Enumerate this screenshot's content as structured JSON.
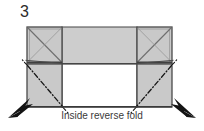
{
  "figure": {
    "step_number": "3",
    "caption": "Inside reverse fold",
    "type": "origami-instruction-diagram",
    "colors": {
      "paper_fill": "#c9c9c9",
      "paper_fill_light": "#d4d4d4",
      "outline": "#4a4a4a",
      "crease_line": "#8a8a8a",
      "dash_dot_line": "#1a1a1a",
      "arrow": "#1a1a1a",
      "background": "#ffffff",
      "text": "#2b2b2b"
    },
    "panels": [
      {
        "name": "top-left-square",
        "fill": "paper_fill",
        "marks": "diagonals"
      },
      {
        "name": "top-middle-rect",
        "fill": "paper_fill",
        "marks": "none"
      },
      {
        "name": "top-right-square",
        "fill": "paper_fill",
        "marks": "diagonals"
      },
      {
        "name": "bottom-left-square",
        "fill": "paper_fill",
        "marks": "dash-dot-diagonal"
      },
      {
        "name": "bottom-middle-rect",
        "fill": "background",
        "marks": "none"
      },
      {
        "name": "bottom-right-square",
        "fill": "paper_fill",
        "marks": "dash-dot-diagonal"
      }
    ],
    "arrows": [
      {
        "name": "left-fold-arrow",
        "direction": "up-right"
      },
      {
        "name": "right-fold-arrow",
        "direction": "up-left"
      }
    ],
    "geometry": {
      "left": 27,
      "right": 172,
      "top": 27,
      "bottom": 107,
      "mid_y": 64,
      "left_panel_right": 62,
      "right_panel_left": 137
    }
  }
}
